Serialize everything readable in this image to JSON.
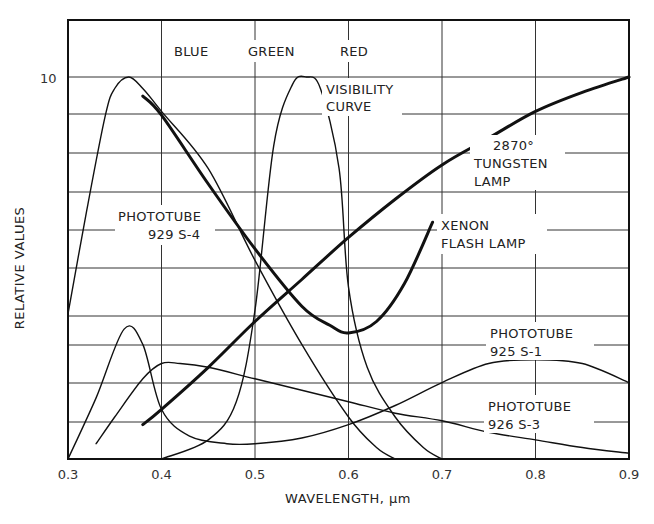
{
  "chart_data": {
    "type": "line",
    "title": "",
    "xlabel": "WAVELENGTH, μm",
    "ylabel": "RELATIVE VALUES",
    "xlim": [
      0.3,
      0.9
    ],
    "ylim": [
      0,
      10
    ],
    "x_ticks": [
      "0.3",
      "0.4",
      "0.5",
      "0.6",
      "0.7",
      "0.8",
      "0.9"
    ],
    "y_ticks": [
      "10"
    ],
    "grid": true,
    "band_labels": [
      "BLUE",
      "GREEN",
      "RED"
    ],
    "series": [
      {
        "name": "PHOTOTUBE 929 S-4",
        "stroke": "thin",
        "x": [
          0.3,
          0.32,
          0.34,
          0.35,
          0.365,
          0.38,
          0.4,
          0.45,
          0.5,
          0.55,
          0.6,
          0.63,
          0.65
        ],
        "y": [
          3.8,
          6.5,
          9.0,
          9.7,
          10.0,
          9.7,
          9.1,
          7.6,
          5.2,
          3.0,
          1.1,
          0.3,
          0.0
        ]
      },
      {
        "name": "VISIBILITY CURVE",
        "stroke": "thin",
        "x": [
          0.4,
          0.45,
          0.48,
          0.5,
          0.52,
          0.54,
          0.555,
          0.57,
          0.59,
          0.6,
          0.62,
          0.65,
          0.68,
          0.7
        ],
        "y": [
          0.0,
          0.5,
          1.5,
          3.9,
          8.2,
          9.8,
          10.0,
          9.7,
          7.6,
          4.5,
          2.4,
          1.1,
          0.3,
          0.0
        ]
      },
      {
        "name": "XENON FLASH LAMP",
        "stroke": "thick",
        "x": [
          0.38,
          0.4,
          0.45,
          0.5,
          0.55,
          0.58,
          0.6,
          0.63,
          0.66,
          0.69
        ],
        "y": [
          9.5,
          9.0,
          7.2,
          5.5,
          4.0,
          3.5,
          3.3,
          3.6,
          4.6,
          6.2
        ]
      },
      {
        "name": "2870° TUNGSTEN LAMP",
        "stroke": "thick",
        "x": [
          0.38,
          0.4,
          0.45,
          0.5,
          0.55,
          0.6,
          0.65,
          0.7,
          0.75,
          0.8,
          0.85,
          0.9
        ],
        "y": [
          0.9,
          1.3,
          2.4,
          3.6,
          4.7,
          5.8,
          6.8,
          7.7,
          8.4,
          9.1,
          9.6,
          10.0
        ]
      },
      {
        "name": "PHOTOTUBE 925 S-1",
        "stroke": "thin",
        "x": [
          0.33,
          0.35,
          0.38,
          0.4,
          0.42,
          0.45,
          0.5,
          0.55,
          0.6,
          0.65,
          0.7,
          0.75,
          0.8,
          0.85,
          0.9
        ],
        "y": [
          0.4,
          1.1,
          2.1,
          2.5,
          2.5,
          2.4,
          2.1,
          1.8,
          1.5,
          1.2,
          1.0,
          0.7,
          0.5,
          0.3,
          0.15
        ]
      },
      {
        "name": "PHOTOTUBE 926 S-3",
        "stroke": "thin",
        "x": [
          0.3,
          0.33,
          0.36,
          0.38,
          0.4,
          0.43,
          0.47,
          0.5,
          0.55,
          0.6,
          0.65,
          0.7,
          0.75,
          0.8,
          0.85,
          0.9
        ],
        "y": [
          0.0,
          1.6,
          3.4,
          3.0,
          1.3,
          0.6,
          0.4,
          0.4,
          0.55,
          0.9,
          1.4,
          2.0,
          2.5,
          2.6,
          2.5,
          2.0
        ]
      }
    ],
    "annotations": [
      {
        "text": [
          "PHOTOTUBE",
          "929 S-4"
        ]
      },
      {
        "text": [
          "VISIBILITY",
          "CURVE"
        ]
      },
      {
        "text": [
          "2870°",
          "TUNGSTEN",
          "LAMP"
        ]
      },
      {
        "text": [
          "XENON",
          "FLASH LAMP"
        ]
      },
      {
        "text": [
          "PHOTOTUBE",
          "925 S-1"
        ]
      },
      {
        "text": [
          "PHOTOTUBE",
          "926 S-3"
        ]
      }
    ]
  },
  "labels": {
    "blue": "BLUE",
    "green": "GREEN",
    "red": "RED",
    "y_tick_10": "10",
    "xlabel": "WAVELENGTH, μm",
    "ylabel": "RELATIVE VALUES",
    "x_ticks": [
      "0.3",
      "0.4",
      "0.5",
      "0.6",
      "0.7",
      "0.8",
      "0.9"
    ],
    "s4_line1": "PHOTOTUBE",
    "s4_line2": "929 S-4",
    "vis_line1": "VISIBILITY",
    "vis_line2": "CURVE",
    "tung_line1": "2870°",
    "tung_line2": "TUNGSTEN",
    "tung_line3": "LAMP",
    "xenon_line1": "XENON",
    "xenon_line2": "FLASH LAMP",
    "s1_line1": "PHOTOTUBE",
    "s1_line2": "925 S-1",
    "s3_line1": "PHOTOTUBE",
    "s3_line2": "926 S-3"
  }
}
